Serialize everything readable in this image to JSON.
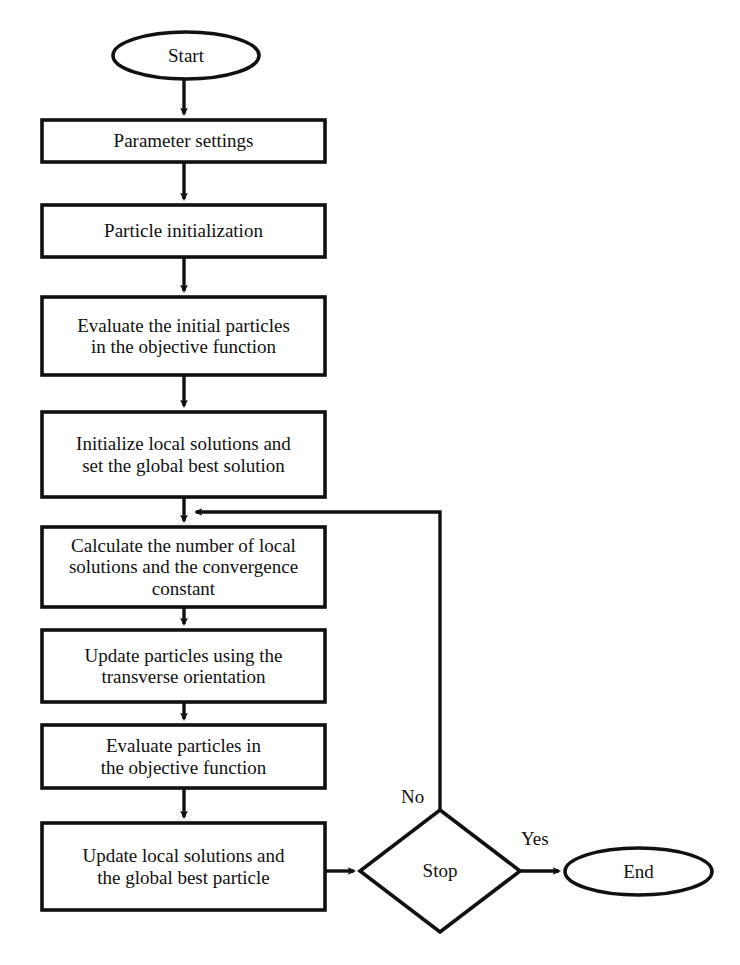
{
  "diagram": {
    "type": "flowchart",
    "orientation": "top-to-bottom",
    "stroke_color": "#111111",
    "fill_color": "#ffffff",
    "background_color": "#ffffff"
  },
  "nodes": {
    "start": {
      "label": "Start",
      "shape": "ellipse",
      "x": 113,
      "y": 32,
      "w": 146,
      "h": 47
    },
    "parameter_settings": {
      "label": "Parameter settings",
      "shape": "rectangle",
      "x": 42,
      "y": 120,
      "w": 283,
      "h": 42
    },
    "particle_initialization": {
      "label": "Particle initialization",
      "shape": "rectangle",
      "x": 42,
      "y": 205,
      "w": 283,
      "h": 52
    },
    "evaluate_initial": {
      "label": "Evaluate the initial particles\nin the objective function",
      "shape": "rectangle",
      "x": 42,
      "y": 297,
      "w": 283,
      "h": 78
    },
    "initialize_local": {
      "label": "Initialize local solutions and\nset the global best solution",
      "shape": "rectangle",
      "x": 42,
      "y": 412,
      "w": 283,
      "h": 85
    },
    "calculate_number": {
      "label": "Calculate the number of local\nsolutions and the convergence\nconstant",
      "shape": "rectangle",
      "x": 42,
      "y": 527,
      "w": 283,
      "h": 80
    },
    "update_particles": {
      "label": "Update particles using the\ntransverse orientation",
      "shape": "rectangle",
      "x": 42,
      "y": 630,
      "w": 283,
      "h": 72
    },
    "evaluate_particles": {
      "label": "Evaluate particles in\nthe objective function",
      "shape": "rectangle",
      "x": 42,
      "y": 725,
      "w": 283,
      "h": 63
    },
    "update_local": {
      "label": "Update local solutions and\nthe global best particle",
      "shape": "rectangle",
      "x": 42,
      "y": 823,
      "w": 283,
      "h": 87
    },
    "stop_decision": {
      "label": "Stop",
      "shape": "diamond",
      "cx": 440,
      "cy": 871,
      "hw": 80,
      "hh": 61
    },
    "end": {
      "label": "End",
      "shape": "ellipse",
      "x": 565,
      "y": 848,
      "w": 147,
      "h": 47
    }
  },
  "edges": [
    {
      "name": "start-to-parameter-settings",
      "label": "",
      "from": "start",
      "to": "parameter_settings"
    },
    {
      "name": "parameter-to-particle-init",
      "label": "",
      "from": "parameter_settings",
      "to": "particle_initialization"
    },
    {
      "name": "particle-init-to-evaluate",
      "label": "",
      "from": "particle_initialization",
      "to": "evaluate_initial"
    },
    {
      "name": "evaluate-to-initialize-local",
      "label": "",
      "from": "evaluate_initial",
      "to": "initialize_local"
    },
    {
      "name": "initialize-to-calculate",
      "label": "",
      "from": "initialize_local",
      "to": "calculate_number"
    },
    {
      "name": "calculate-to-update-particles",
      "label": "",
      "from": "calculate_number",
      "to": "update_particles"
    },
    {
      "name": "update-to-evaluate-particles",
      "label": "",
      "from": "update_particles",
      "to": "evaluate_particles"
    },
    {
      "name": "evaluate-to-update-local",
      "label": "",
      "from": "evaluate_particles",
      "to": "update_local"
    },
    {
      "name": "update-local-to-stop",
      "label": "",
      "from": "update_local",
      "to": "stop_decision"
    },
    {
      "name": "stop-no-loopback",
      "label": "No",
      "from": "stop_decision",
      "to": "calculate_number"
    },
    {
      "name": "stop-yes-to-end",
      "label": "Yes",
      "from": "stop_decision",
      "to": "end"
    }
  ],
  "edge_labels": {
    "no": {
      "text": "No",
      "x": 401,
      "y": 786
    },
    "yes": {
      "text": "Yes",
      "x": 521,
      "y": 828
    }
  }
}
